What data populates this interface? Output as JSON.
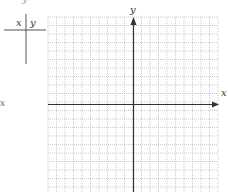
{
  "table": {
    "header_x": "x",
    "header_y": "y",
    "rows": []
  },
  "top_fragment": "y",
  "side_label": "x",
  "chart_data": {
    "type": "scatter",
    "title": "",
    "xlabel": "x",
    "ylabel": "y",
    "grid": true,
    "points": [],
    "grid_cells_x": 20,
    "grid_cells_y": 20,
    "axis_arrows": true
  },
  "colors": {
    "grid": "#bfbfbf",
    "axis": "#333333",
    "table_line": "#555555"
  }
}
